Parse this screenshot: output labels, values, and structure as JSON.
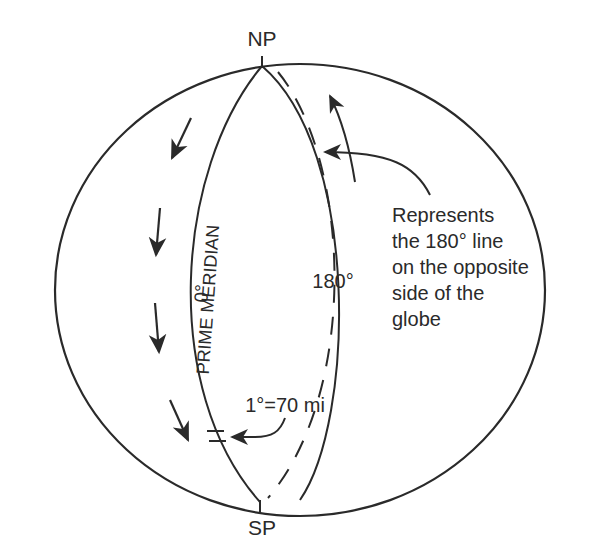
{
  "diagram": {
    "labels": {
      "north_pole": "NP",
      "south_pole": "SP",
      "prime_meridian_degree": "0°",
      "prime_meridian_name": "PRIME MERIDIAN",
      "line_180": "180°",
      "scale": "1°=70 mi"
    },
    "callout": {
      "lines": [
        "Represents",
        "the 180° line",
        "on the opposite",
        "side of the",
        "globe"
      ]
    },
    "colors": {
      "ink": "#2a2a2a",
      "background": "#ffffff"
    }
  }
}
